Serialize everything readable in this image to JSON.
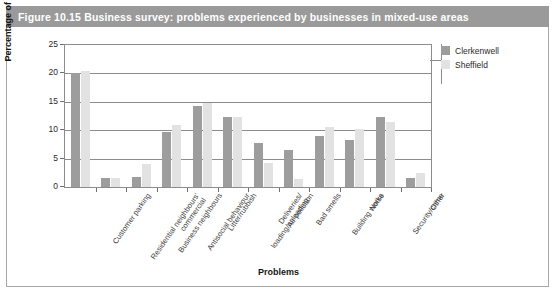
{
  "figure": {
    "caption": "Figure 10.15  Business survey: problems experienced by businesses in mixed-use areas"
  },
  "legend": {
    "items": [
      {
        "label": "Clerkenwell",
        "color": "#9d9d9d"
      },
      {
        "label": "Sheffield",
        "color": "#e2e2e2"
      }
    ]
  },
  "chart_data": {
    "type": "bar",
    "title": "Business survey: problems experienced by businesses in mixed-use areas",
    "xlabel": "Problems",
    "ylabel": "Percentage of responses",
    "ylim": [
      0,
      25
    ],
    "yticks": [
      0,
      5,
      10,
      15,
      20,
      25
    ],
    "ytick_labels": [
      "0",
      "5",
      "10",
      "15",
      "20",
      "25"
    ],
    "grid": "horizontal",
    "legend_position": "right",
    "categories": [
      "Customer parking",
      "Residential neighbours'\ncommercial",
      "Business neighbours",
      "Antisocial behaviour",
      "Litter/rubbish",
      "Deliveries/\nloading/unloading",
      "Air pollution",
      "Bad smells",
      "Building works",
      "Noise",
      "Security/crime",
      "Other"
    ],
    "series": [
      {
        "name": "Clerkenwell",
        "color": "#9d9d9d",
        "values": [
          20.0,
          1.6,
          1.7,
          9.7,
          14.2,
          12.3,
          7.8,
          6.6,
          9.0,
          8.2,
          12.3,
          1.6
        ]
      },
      {
        "name": "Sheffield",
        "color": "#e2e2e2",
        "values": [
          20.4,
          1.6,
          4.0,
          11.0,
          14.8,
          12.3,
          4.2,
          1.4,
          10.5,
          10.2,
          11.5,
          2.4
        ]
      }
    ]
  }
}
